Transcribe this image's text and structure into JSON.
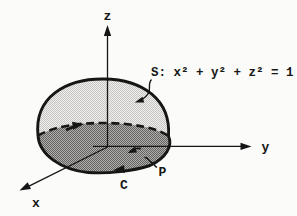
{
  "figure": {
    "kind": "hemisphere-surface-diagram",
    "surface_equation": "S: x² + y² + z² = 1",
    "axes": {
      "x": "x",
      "y": "y",
      "z": "z"
    },
    "curve_label": "C",
    "point_label": "P",
    "colors": {
      "background": "#fbfbf9",
      "ink": "#161616",
      "dome_light_a": "#f0efed",
      "dome_light_b": "#c6c5c2",
      "band_dark_a": "#b0afac",
      "band_dark_b": "#636260"
    }
  }
}
